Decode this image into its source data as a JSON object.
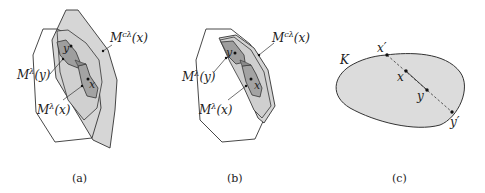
{
  "figure": {
    "panels": [
      {
        "id": "a",
        "caption": "(a)",
        "labels": {
          "mclx": "M",
          "mclx_sup": "cλ",
          "mclx_arg": "(x)",
          "mly": "M",
          "mly_sup": "λ",
          "mly_arg": "(y)",
          "mlx": "M",
          "mlx_sup": "λ",
          "mlx_arg": "(x)",
          "pt_y": "y",
          "pt_x": "x"
        }
      },
      {
        "id": "b",
        "caption": "(b)",
        "labels": {
          "mclx": "M",
          "mclx_sup": "cλ",
          "mclx_arg": "(x)",
          "mly": "M",
          "mly_sup": "λ",
          "mly_arg": "(y)",
          "mlx": "M",
          "mlx_sup": "λ",
          "mlx_arg": "(x)",
          "pt_y": "y",
          "pt_x": "x"
        }
      },
      {
        "id": "c",
        "caption": "(c)",
        "labels": {
          "set": "K",
          "xp": "x′",
          "x": "x",
          "y": "y",
          "yp": "y′"
        }
      }
    ],
    "colors": {
      "stroke": "#333333",
      "light_fill": "#d9d9d9",
      "mid_fill": "#c4c4c4",
      "dark_fill": "#9a9a9a",
      "white": "#ffffff"
    }
  }
}
